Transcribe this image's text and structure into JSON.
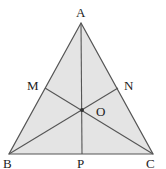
{
  "diagram": {
    "type": "triangle-medians",
    "fill_color": "#e4e4e4",
    "stroke_color": "#555555",
    "point_color": "#333333",
    "vertices": {
      "A": "A",
      "B": "B",
      "C": "C"
    },
    "points": {
      "M": "M",
      "N": "N",
      "O": "O",
      "P": "P"
    },
    "segments": [
      {
        "from": "A",
        "to": "P"
      },
      {
        "from": "B",
        "to": "N"
      },
      {
        "from": "C",
        "to": "M"
      }
    ]
  }
}
